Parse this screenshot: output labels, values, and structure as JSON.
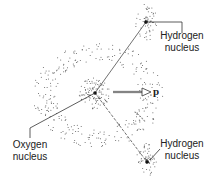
{
  "labels": {
    "top_hydrogen": {
      "line1": "Hydrogen",
      "line2": "nucleus"
    },
    "bottom_hydrogen": {
      "line1": "Hydrogen",
      "line2": "nucleus"
    },
    "oxygen": {
      "line1": "Oxygen",
      "line2": "nucleus"
    },
    "dipole": "p"
  },
  "colors": {
    "ink": "#222222",
    "dots": "#555555"
  }
}
